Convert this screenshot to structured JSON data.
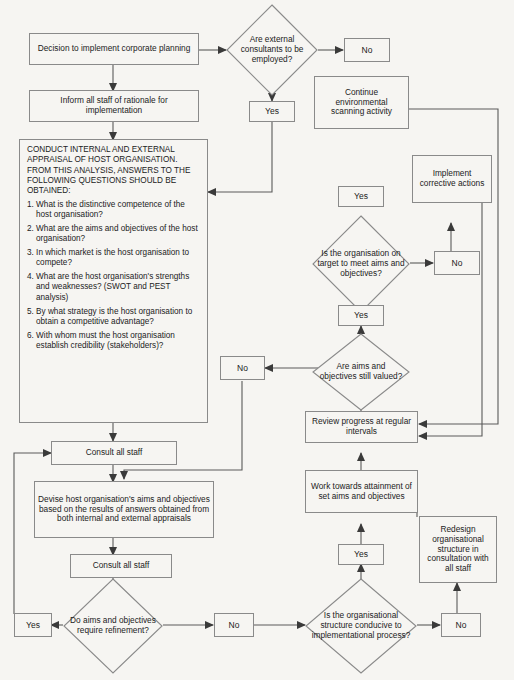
{
  "diagram": {
    "colors": {
      "background": "#f6f5f2",
      "stroke": "#8a8a8a",
      "connector": "#4a4a4a",
      "text": "#222222"
    },
    "nodes": {
      "decision_implement": "Decision to implement corporate planning",
      "inform_staff": "Inform all staff of rationale for implementation",
      "conduct_appraisal_head": "CONDUCT INTERNAL AND EXTERNAL APPRAISAL OF HOST ORGANISATION. FROM THIS ANALYSIS, ANSWERS TO THE FOLLOWING QUESTIONS SHOULD BE OBTAINED:",
      "conduct_appraisal_questions": [
        "1. What is the distinctive competence of the host organisation?",
        "2. What are the aims and  objectives of the host organisation?",
        "3. In which market is the host organisation to compete?",
        "4. What are the host organisation's strengths and weaknesses? (SWOT and PEST analysis)",
        "5. By what strategy is the host organisation to obtain a competitive advantage?",
        "6. With whom must the host organisation establish credibility (stakeholders)?"
      ],
      "external_consultants_decision": "Are external consultants to be employed?",
      "external_consultants_no": "No",
      "external_consultants_yes": "Yes",
      "continue_scanning": "Continue environmental scanning activity",
      "on_target_yes": "Yes",
      "on_target_decision": "Is the organisation on target to meet aims and objectives?",
      "on_target_no": "No",
      "implement_corrective": "Implement corrective actions",
      "aims_valued_yes": "Yes",
      "aims_valued_decision": "Are aims and objectives still valued?",
      "aims_valued_no": "No",
      "review_progress": "Review progress at regular intervals",
      "work_towards": "Work towards attainment of set aims and objectives",
      "structure_yes": "Yes",
      "structure_decision": "Is the organisational structure conducive to implementational process?",
      "structure_no": "No",
      "redesign_structure": "Redesign organisational structure in consultation with all staff",
      "consult_all_staff_1": "Consult all staff",
      "devise_aims": "Devise host organisation's aims and objectives based on the results of answers obtained from both internal and external appraisals",
      "consult_all_staff_2": "Consult all staff",
      "refinement_yes": "Yes",
      "refinement_decision": "Do aims and objectives require refinement?",
      "refinement_no": "No"
    }
  }
}
